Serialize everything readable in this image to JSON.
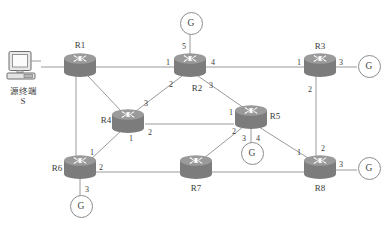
{
  "diagram": {
    "colors": {
      "router_body": "#7c7c7c",
      "router_top": "#9a9a9a",
      "router_arrow": "#ffffff",
      "link": "#9a9a9a",
      "text": "#3a3a3a",
      "background": "#ffffff"
    }
  },
  "terminal": {
    "icon": "desktop-computer-icon",
    "label": "源终端",
    "sublabel": "S"
  },
  "routers": [
    {
      "id": "R1",
      "label": "R1",
      "x": 80,
      "y": 65,
      "label_x": 80,
      "label_y": 45
    },
    {
      "id": "R2",
      "label": "R2",
      "x": 190,
      "y": 65,
      "label_x": 197,
      "label_y": 88
    },
    {
      "id": "R3",
      "label": "R3",
      "x": 320,
      "y": 65,
      "label_x": 320,
      "label_y": 46
    },
    {
      "id": "R4",
      "label": "R4",
      "x": 128,
      "y": 121,
      "label_x": 106,
      "label_y": 120
    },
    {
      "id": "R5",
      "label": "R5",
      "x": 251,
      "y": 117,
      "label_x": 275,
      "label_y": 116
    },
    {
      "id": "R6",
      "label": "R6",
      "x": 80,
      "y": 167,
      "label_x": 57,
      "label_y": 168
    },
    {
      "id": "R7",
      "label": "R7",
      "x": 196,
      "y": 167,
      "label_x": 196,
      "label_y": 188
    },
    {
      "id": "R8",
      "label": "R8",
      "x": 320,
      "y": 167,
      "label_x": 320,
      "label_y": 188
    }
  ],
  "gateways": [
    {
      "id": "G-R2",
      "label": "G",
      "x": 190,
      "y": 22,
      "attached_to": "R2",
      "port": "5"
    },
    {
      "id": "G-R3",
      "label": "G",
      "x": 368,
      "y": 65,
      "attached_to": "R3",
      "port": "3"
    },
    {
      "id": "G-R5",
      "label": "G",
      "x": 251,
      "y": 152,
      "attached_to": "R5",
      "port": "3"
    },
    {
      "id": "G-R6",
      "label": "G",
      "x": 80,
      "y": 205,
      "attached_to": "R6",
      "port": "3"
    },
    {
      "id": "G-R8",
      "label": "G",
      "x": 368,
      "y": 167,
      "attached_to": "R8",
      "port": "3"
    }
  ],
  "links": [
    {
      "from": "S",
      "to": "R1",
      "x1": 41,
      "y1": 67,
      "x2": 80,
      "y2": 67
    },
    {
      "from": "R1",
      "to": "R2",
      "x1": 80,
      "y1": 67,
      "x2": 190,
      "y2": 67
    },
    {
      "from": "R1",
      "to": "R4",
      "x1": 88,
      "y1": 76,
      "x2": 122,
      "y2": 112
    },
    {
      "from": "R1",
      "to": "R6",
      "x1": 76,
      "y1": 76,
      "x2": 76,
      "y2": 158
    },
    {
      "from": "R2",
      "to": "G",
      "x1": 190,
      "y1": 55,
      "x2": 190,
      "y2": 33
    },
    {
      "from": "R2",
      "to": "R3",
      "x1": 190,
      "y1": 67,
      "x2": 320,
      "y2": 67
    },
    {
      "from": "R2",
      "to": "R4",
      "x1": 182,
      "y1": 76,
      "x2": 136,
      "y2": 111
    },
    {
      "from": "R2",
      "to": "R5",
      "x1": 198,
      "y1": 76,
      "x2": 244,
      "y2": 108
    },
    {
      "from": "R3",
      "to": "G",
      "x1": 332,
      "y1": 67,
      "x2": 357,
      "y2": 67
    },
    {
      "from": "R3",
      "to": "R8",
      "x1": 316,
      "y1": 76,
      "x2": 316,
      "y2": 157
    },
    {
      "from": "R4",
      "to": "R5",
      "x1": 145,
      "y1": 124,
      "x2": 234,
      "y2": 124
    },
    {
      "from": "R4",
      "to": "R6",
      "x1": 122,
      "y1": 130,
      "x2": 90,
      "y2": 160
    },
    {
      "from": "R5",
      "to": "G",
      "x1": 251,
      "y1": 128,
      "x2": 251,
      "y2": 143
    },
    {
      "from": "R5",
      "to": "R7",
      "x1": 243,
      "y1": 127,
      "x2": 204,
      "y2": 158
    },
    {
      "from": "R5",
      "to": "R8",
      "x1": 259,
      "y1": 127,
      "x2": 308,
      "y2": 158
    },
    {
      "from": "R6",
      "to": "G",
      "x1": 80,
      "y1": 178,
      "x2": 80,
      "y2": 196
    },
    {
      "from": "R6",
      "to": "R7",
      "x1": 80,
      "y1": 172,
      "x2": 196,
      "y2": 172
    },
    {
      "from": "R7",
      "to": "R8",
      "x1": 196,
      "y1": 172,
      "x2": 320,
      "y2": 172
    },
    {
      "from": "R8",
      "to": "G",
      "x1": 332,
      "y1": 170,
      "x2": 357,
      "y2": 170
    }
  ],
  "port_labels": [
    {
      "router": "R2",
      "port": "1",
      "x": 168,
      "y": 62
    },
    {
      "router": "R2",
      "port": "2",
      "x": 171,
      "y": 84
    },
    {
      "router": "R2",
      "port": "3",
      "x": 211,
      "y": 85
    },
    {
      "router": "R2",
      "port": "4",
      "x": 213,
      "y": 62
    },
    {
      "router": "R2",
      "port": "5",
      "x": 184,
      "y": 46
    },
    {
      "router": "R3",
      "port": "1",
      "x": 299,
      "y": 62
    },
    {
      "router": "R3",
      "port": "2",
      "x": 310,
      "y": 89
    },
    {
      "router": "R3",
      "port": "3",
      "x": 341,
      "y": 62
    },
    {
      "router": "R4",
      "port": "3",
      "x": 146,
      "y": 103
    },
    {
      "router": "R4",
      "port": "2",
      "x": 150,
      "y": 132
    },
    {
      "router": "R4",
      "port": "1",
      "x": 131,
      "y": 138
    },
    {
      "router": "R5",
      "port": "1",
      "x": 231,
      "y": 112
    },
    {
      "router": "R5",
      "port": "2",
      "x": 234,
      "y": 131
    },
    {
      "router": "R5",
      "port": "3",
      "x": 244,
      "y": 138
    },
    {
      "router": "R5",
      "port": "4",
      "x": 258,
      "y": 138
    },
    {
      "router": "R6",
      "port": "1",
      "x": 92,
      "y": 152
    },
    {
      "router": "R6",
      "port": "2",
      "x": 101,
      "y": 167
    },
    {
      "router": "R6",
      "port": "3",
      "x": 87,
      "y": 189
    },
    {
      "router": "R8",
      "port": "1",
      "x": 299,
      "y": 152
    },
    {
      "router": "R8",
      "port": "2",
      "x": 323,
      "y": 148
    },
    {
      "router": "R8",
      "port": "3",
      "x": 341,
      "y": 164
    }
  ]
}
